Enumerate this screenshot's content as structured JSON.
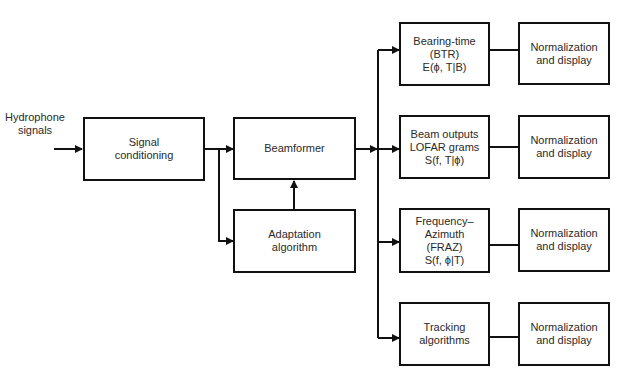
{
  "diagram": {
    "input_label": "Hydrophone\nsignals",
    "nodes": {
      "signal_conditioning": "Signal\nconditioning",
      "beamformer": "Beamformer",
      "adaptation": "Adaptation\nalgorithm",
      "btr": "Bearing-time\n(BTR)\nE(ϕ, T|B)",
      "lofar": "Beam outputs\nLOFAR grams\nS(f, T|ϕ)",
      "fraz": "Frequency–\nAzimuth\n(FRAZ)\nS(f, ϕ|T)",
      "tracking": "Tracking\nalgorithms",
      "norm1": "Normalization\nand display",
      "norm2": "Normalization\nand display",
      "norm3": "Normalization\nand display",
      "norm4": "Normalization\nand display"
    },
    "edges": [
      [
        "input",
        "signal_conditioning"
      ],
      [
        "signal_conditioning",
        "beamformer"
      ],
      [
        "signal_conditioning",
        "adaptation"
      ],
      [
        "adaptation",
        "beamformer"
      ],
      [
        "beamformer",
        "btr"
      ],
      [
        "beamformer",
        "lofar"
      ],
      [
        "beamformer",
        "fraz"
      ],
      [
        "beamformer",
        "tracking"
      ],
      [
        "btr",
        "norm1"
      ],
      [
        "lofar",
        "norm2"
      ],
      [
        "fraz",
        "norm3"
      ],
      [
        "tracking",
        "norm4"
      ]
    ]
  }
}
